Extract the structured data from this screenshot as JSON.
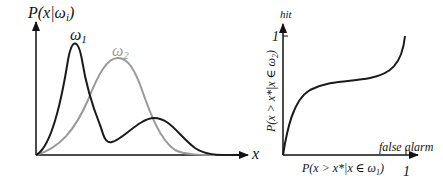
{
  "left_plot": {
    "y_label": "P(x|ω",
    "y_label_sub": "i",
    "y_label_end": ")",
    "x_label": "x",
    "curves": [
      {
        "name": "ω",
        "sub": "1",
        "color": "#1a1a1a",
        "description": "bimodal: tall narrow peak left, smaller peak right"
      },
      {
        "name": "ω",
        "sub": "2",
        "color": "#999999",
        "description": "unimodal broad peak in middle"
      }
    ]
  },
  "right_plot": {
    "y_axis_top_label": "hit",
    "y_tick": "1",
    "y_label": "P(x > x*|x ∈ ω",
    "y_label_sub": "2",
    "y_label_end": ")",
    "x_axis_label": "false alarm",
    "x_label": "P(x > x*|x ∈ ω",
    "x_label_sub": "1",
    "x_label_end": ")",
    "x_tick": "1"
  }
}
